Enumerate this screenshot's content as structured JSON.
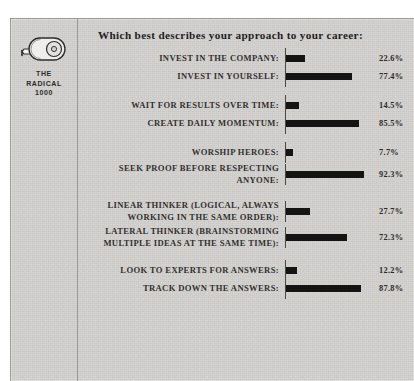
{
  "brand": {
    "icon": "tape-measure-icon",
    "line1": "THE",
    "line2": "RADICAL",
    "line3": "1000"
  },
  "chart_data": {
    "type": "bar",
    "title": "Which best describes your approach to your career:",
    "xlabel": "",
    "ylabel": "",
    "xlim": [
      0,
      100
    ],
    "grid": false,
    "legend": "none",
    "orientation": "horizontal",
    "value_suffix": "%",
    "groups": [
      {
        "categories": [
          "INVEST IN THE COMPANY:",
          "INVEST IN YOURSELF:"
        ],
        "values": [
          22.6,
          77.4
        ],
        "labels": [
          "22.6%",
          "77.4%"
        ]
      },
      {
        "categories": [
          "WAIT FOR RESULTS OVER TIME:",
          "CREATE DAILY MOMENTUM:"
        ],
        "values": [
          14.5,
          85.5
        ],
        "labels": [
          "14.5%",
          "85.5%"
        ]
      },
      {
        "categories": [
          "WORSHIP HEROES:",
          "SEEK PROOF BEFORE RESPECTING ANYONE:"
        ],
        "values": [
          7.7,
          92.3
        ],
        "labels": [
          "7.7%",
          "92.3%"
        ]
      },
      {
        "categories": [
          "LINEAR THINKER (LOGICAL, ALWAYS WORKING IN THE SAME ORDER):",
          "LATERAL THINKER (BRAINSTORMING MULTIPLE IDEAS AT THE SAME TIME):"
        ],
        "values": [
          27.7,
          72.3
        ],
        "labels": [
          "27.7%",
          "72.3%"
        ]
      },
      {
        "categories": [
          "LOOK TO EXPERTS FOR ANSWERS:",
          "TRACK DOWN THE ANSWERS:"
        ],
        "values": [
          12.2,
          87.8
        ],
        "labels": [
          "12.2%",
          "87.8%"
        ]
      }
    ]
  },
  "colors": {
    "bar": "#141414",
    "axis": "#4a4745",
    "paper": "#d2d1ce",
    "text": "#33302f"
  }
}
